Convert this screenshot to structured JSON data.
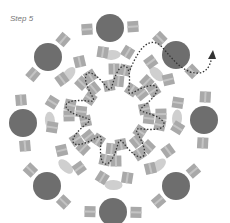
{
  "title": "Step 5",
  "colors": {
    "table": "#6e6e6e",
    "chair": "#a9a9a9",
    "pill": "#cfcfcf",
    "path": "#333333"
  },
  "center": [
    115,
    115
  ],
  "outer_tables": [
    {
      "x": 110,
      "y": 28
    },
    {
      "x": 176,
      "y": 55
    },
    {
      "x": 204,
      "y": 120
    },
    {
      "x": 176,
      "y": 186
    },
    {
      "x": 113,
      "y": 212
    },
    {
      "x": 47,
      "y": 186
    },
    {
      "x": 23,
      "y": 123
    },
    {
      "x": 48,
      "y": 57
    }
  ],
  "path_label": "walking route with arrow"
}
